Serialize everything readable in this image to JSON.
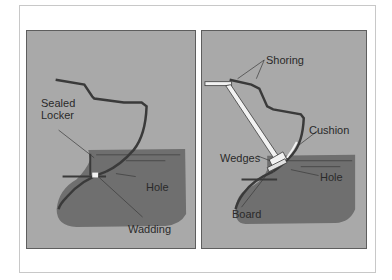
{
  "figure": {
    "panels": [
      {
        "id": "left",
        "description": "Sealed locker with wadding over hole",
        "labels": {
          "sealed_locker_line1": "Sealed",
          "sealed_locker_line2": "Locker",
          "hole": "Hole",
          "wadding": "Wadding"
        }
      },
      {
        "id": "right",
        "description": "Shoring braced against cushion and board over hole",
        "labels": {
          "shoring": "Shoring",
          "cushion": "Cushion",
          "wedges": "Wedges",
          "hole": "Hole",
          "board": "Board"
        }
      }
    ],
    "colors": {
      "background": "#a9a9a9",
      "water": "#6f6f6f",
      "hull_line": "#3a3a3a",
      "shoring": "#f2f2f2",
      "text": "#2a2a2a"
    }
  }
}
